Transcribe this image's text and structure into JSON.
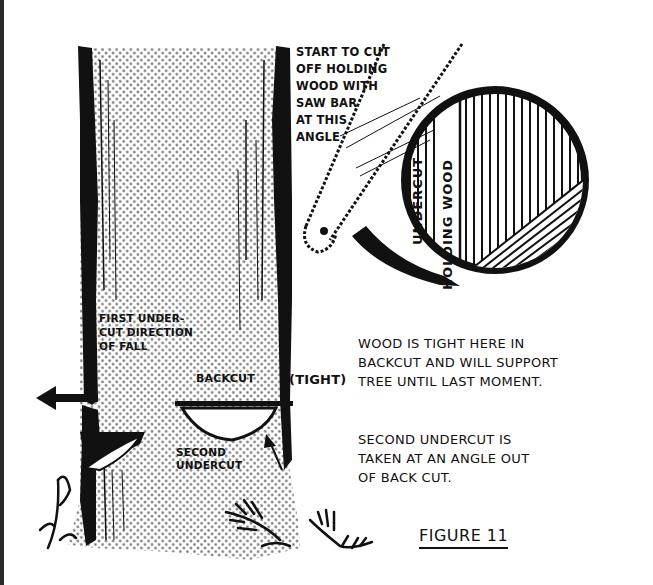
{
  "figure": {
    "caption": "FIGURE 11",
    "style": "black-and-white line illustration with halftone shading",
    "colors": {
      "ink": "#111111",
      "paper": "#ffffff",
      "halftone": "#6a6a6a"
    }
  },
  "trunk_labels": {
    "first_undercut": "FIRST UNDER-\nCUT DIRECTION\nOF FALL",
    "backcut": "BACKCUT",
    "tight": "(TIGHT)",
    "second_undercut": "SECOND\nUNDERCUT"
  },
  "saw_label": "START TO CUT\nOFF HOLDING\nWOOD WITH\nSAW BAR\nAT THIS\nANGLE",
  "cross_section": {
    "undercut_label": "UNDERCUT",
    "holding_wood_label": "HOLDING WOOD"
  },
  "notes": {
    "tight_note": "WOOD IS TIGHT HERE IN\nBACKCUT AND WILL SUPPORT\nTREE UNTIL LAST MOMENT.",
    "second_note": "SECOND UNDERCUT IS\nTAKEN AT AN ANGLE OUT\nOF BACK CUT."
  },
  "icons": {
    "fall_direction": "arrow-left-icon",
    "saw": "chainsaw-bar-icon",
    "stump_cross_section": "tree-cross-section-icon",
    "undercut_arrow": "arrow-up-icon"
  }
}
